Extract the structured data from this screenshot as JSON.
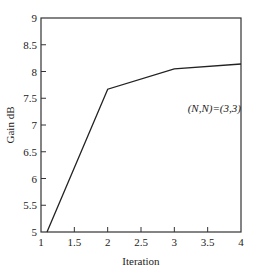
{
  "chart_data": {
    "type": "line",
    "title": "",
    "xlabel": "Iteration",
    "ylabel": "Gain dB",
    "xlim": [
      1,
      4
    ],
    "ylim": [
      5,
      9
    ],
    "xticks": [
      1,
      1.5,
      2,
      2.5,
      3,
      3.5,
      4
    ],
    "xtick_labels": [
      "1",
      "1.5",
      "2",
      "2.5",
      "3",
      "3.5",
      "4"
    ],
    "yticks": [
      5,
      5.5,
      6,
      6.5,
      7,
      7.5,
      8,
      8.5,
      9
    ],
    "ytick_labels": [
      "5",
      "5.5",
      "6",
      "6.5",
      "7",
      "7.5",
      "8",
      "8.5",
      "9"
    ],
    "grid": false,
    "legend": null,
    "series": [
      {
        "name": "(N,N)=(3,3)",
        "x": [
          1.09,
          2,
          3,
          4
        ],
        "y": [
          5.0,
          7.67,
          8.05,
          8.14
        ],
        "color": "#222222"
      }
    ],
    "annotations": [
      {
        "text": "(N,N)=(3,3)",
        "x": 3.2,
        "y": 7.25
      }
    ]
  }
}
